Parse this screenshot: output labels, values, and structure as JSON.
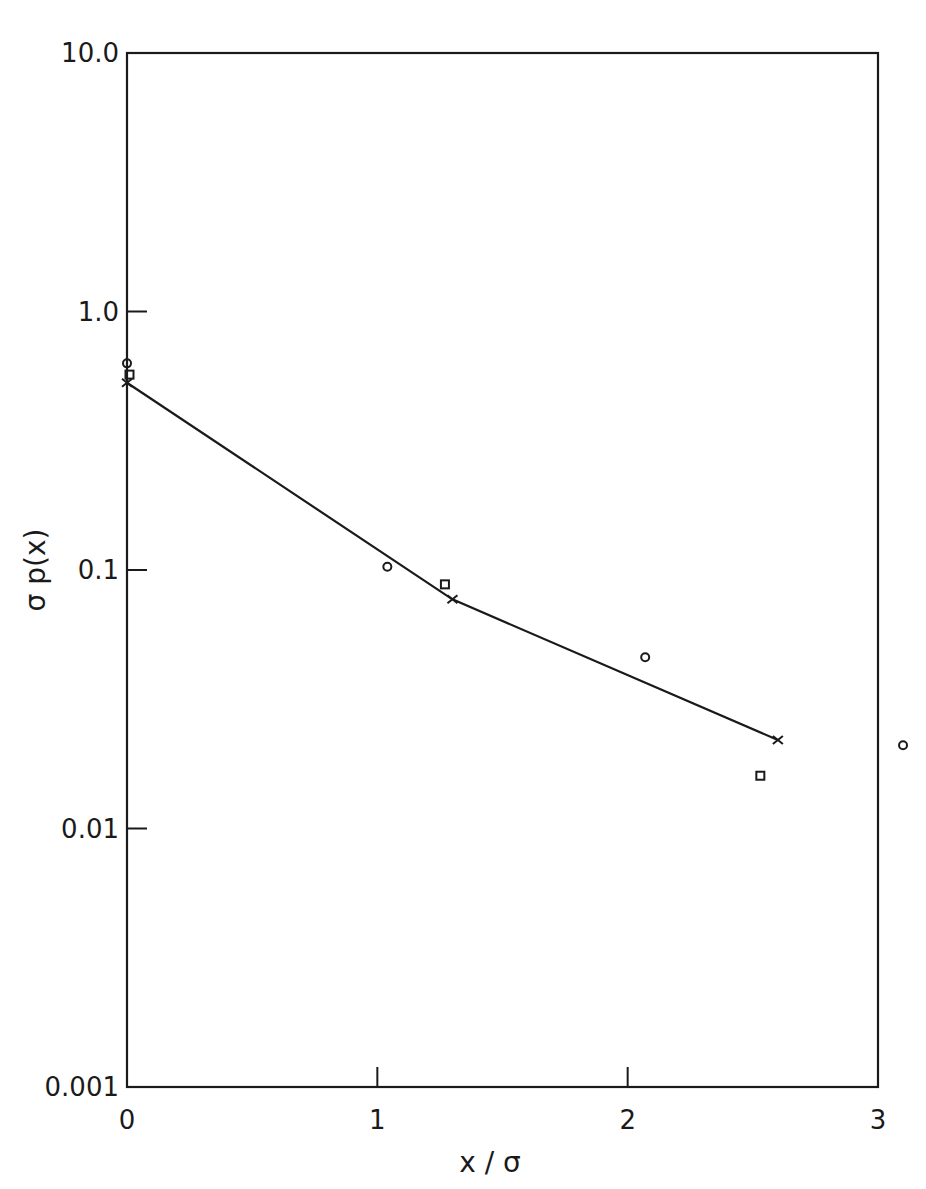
{
  "chart_data": {
    "type": "scatter",
    "title": "",
    "xlabel": "x / σ",
    "ylabel": "σ p(x)",
    "xlim": [
      0,
      3
    ],
    "ylim": [
      0.001,
      10.0
    ],
    "yscale": "log",
    "grid": false,
    "legend": null,
    "x_ticks": [
      0,
      1,
      2,
      3
    ],
    "x_tick_labels": [
      "0",
      "1",
      "2",
      "3"
    ],
    "y_ticks": [
      10.0,
      1.0,
      0.1,
      0.01,
      0.001
    ],
    "y_tick_labels": [
      "10.0",
      "1.0",
      "0.1",
      "0.01",
      "0.001"
    ],
    "series": [
      {
        "name": "crosses (connected line)",
        "marker": "x",
        "line": true,
        "points": [
          {
            "x": 0.0,
            "y": 0.53
          },
          {
            "x": 1.3,
            "y": 0.077
          },
          {
            "x": 2.6,
            "y": 0.022
          }
        ]
      },
      {
        "name": "circles",
        "marker": "o",
        "line": false,
        "points": [
          {
            "x": 0.0,
            "y": 0.63
          },
          {
            "x": 1.04,
            "y": 0.103
          },
          {
            "x": 2.07,
            "y": 0.046
          },
          {
            "x": 3.1,
            "y": 0.021
          }
        ]
      },
      {
        "name": "squares",
        "marker": "s",
        "line": false,
        "points": [
          {
            "x": 0.01,
            "y": 0.57
          },
          {
            "x": 1.27,
            "y": 0.088
          },
          {
            "x": 2.53,
            "y": 0.016
          }
        ]
      }
    ]
  },
  "axes": {
    "x_title": "x / σ",
    "y_title": "σ p(x)"
  }
}
